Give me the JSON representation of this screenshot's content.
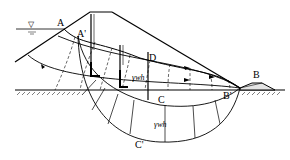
{
  "diagram": {
    "labels": {
      "A": "A",
      "A_prime": "A'",
      "B": "B",
      "B_prime": "B'",
      "C": "C",
      "C_prime": "C'",
      "D": "D",
      "pressure_upper": "γwh",
      "pressure_lower": "γwh"
    },
    "symbols": {
      "water_level": "▽"
    },
    "colors": {
      "line": "#000000",
      "background": "#ffffff",
      "drain_fill": "#d8d8d8"
    }
  }
}
